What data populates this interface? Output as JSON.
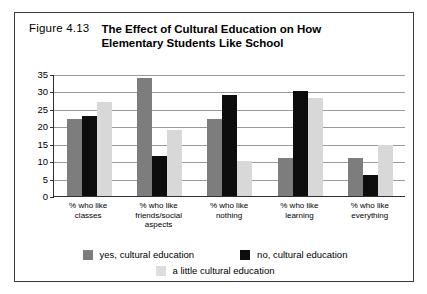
{
  "caption": {
    "figure_number": "Figure 4.13",
    "title_line_1": "The Effect of Cultural Education on How",
    "title_line_2": "Elementary Students Like School"
  },
  "legend": {
    "entries": [
      {
        "label": "yes, cultural education",
        "swatch": "#7d7d7d"
      },
      {
        "label": "no, cultural education",
        "swatch": "#0d0d0d"
      },
      {
        "label": "a little cultural education",
        "swatch": "#dddddd"
      }
    ]
  },
  "axis": {
    "y_ticks": [
      "35",
      "30",
      "25",
      "20",
      "15",
      "10",
      "5",
      "0"
    ]
  },
  "x_labels": [
    {
      "line1": "% who like",
      "line2": "classes",
      "line3": ""
    },
    {
      "line1": "% who like",
      "line2": "friends/social",
      "line3": "aspects"
    },
    {
      "line1": "% who like",
      "line2": "nothing",
      "line3": ""
    },
    {
      "line1": "% who like",
      "line2": "learning",
      "line3": ""
    },
    {
      "line1": "% who like",
      "line2": "everything",
      "line3": ""
    }
  ],
  "chart_data": {
    "type": "bar",
    "title": "The Effect of Cultural Education on How Elementary Students Like School",
    "xlabel": "",
    "ylabel": "",
    "ylim": [
      0,
      35
    ],
    "yticks": [
      0,
      5,
      10,
      15,
      20,
      25,
      30,
      35
    ],
    "grid": true,
    "legend_position": "bottom",
    "categories": [
      "% who like classes",
      "% who like friends/social aspects",
      "% who like nothing",
      "% who like learning",
      "% who like everything"
    ],
    "series": [
      {
        "name": "yes, cultural education",
        "color": "#7d7d7d",
        "values": [
          22,
          34,
          22,
          11,
          11
        ]
      },
      {
        "name": "no, cultural education",
        "color": "#0d0d0d",
        "values": [
          23,
          11.5,
          29,
          30,
          6
        ]
      },
      {
        "name": "a little cultural education",
        "color": "#dddddd",
        "values": [
          27,
          19,
          10,
          28,
          14.5
        ]
      }
    ]
  }
}
